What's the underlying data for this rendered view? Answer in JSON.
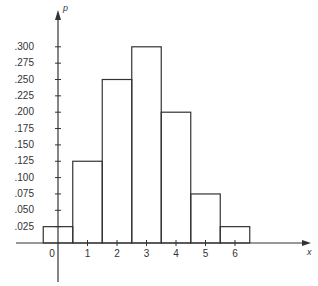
{
  "chart_data": {
    "type": "bar",
    "title": "",
    "xlabel": "x",
    "ylabel": "p",
    "categories": [
      "0",
      "1",
      "2",
      "3",
      "4",
      "5",
      "6"
    ],
    "values": [
      0.025,
      0.125,
      0.25,
      0.3,
      0.2,
      0.075,
      0.025
    ],
    "x_ticks": [
      "0",
      "1",
      "2",
      "3",
      "4",
      "5",
      "6"
    ],
    "y_ticks": [
      ".025",
      ".050",
      ".075",
      ".100",
      ".125",
      ".150",
      ".175",
      ".200",
      ".225",
      ".250",
      ".275",
      ".300"
    ],
    "ylim": [
      0,
      0.32
    ],
    "xlim": [
      -1.5,
      8.5
    ],
    "grid": false,
    "legend": null,
    "bar_style": "outlined histogram, unit-width bars centered on integers"
  },
  "colors": {
    "line": "#333333",
    "background": "#ffffff"
  }
}
